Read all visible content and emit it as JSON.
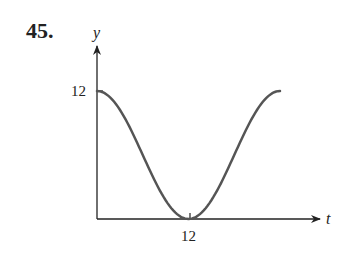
{
  "problem": {
    "number": "45."
  },
  "chart_data": {
    "type": "line",
    "title": "",
    "xlabel": "t",
    "ylabel": "y",
    "x_ticks": [
      "12"
    ],
    "y_ticks": [
      "12"
    ],
    "xlim": [
      0,
      24
    ],
    "ylim": [
      0,
      12
    ],
    "grid": false,
    "series": [
      {
        "name": "curve",
        "x": [
          0,
          3,
          6,
          9,
          12,
          15,
          18,
          21,
          24
        ],
        "values": [
          12,
          10.24,
          6,
          1.76,
          0,
          1.76,
          6,
          10.24,
          12
        ]
      }
    ]
  },
  "colors": {
    "curve": "#555555",
    "axes": "#222222"
  }
}
